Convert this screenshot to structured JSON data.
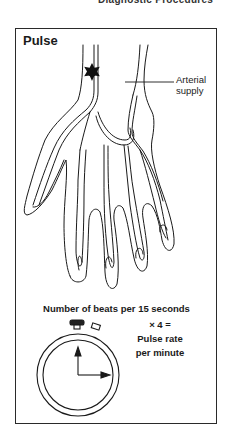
{
  "header": {
    "cut_text": "Diagnostic Procedures"
  },
  "figure": {
    "title": "Pulse",
    "labels": {
      "arterial_line1": "Arterial",
      "arterial_line2": "supply"
    },
    "formula": {
      "line1": "Number of beats per 15 seconds",
      "line2": "× 4 =",
      "line3": "Pulse rate",
      "line4": "per minute"
    },
    "icons": [
      "hand-arteries-illustration",
      "pulse-point-star-icon",
      "stopwatch-icon"
    ],
    "colors": {
      "stroke": "#1a1a1a",
      "background": "#ffffff"
    }
  }
}
